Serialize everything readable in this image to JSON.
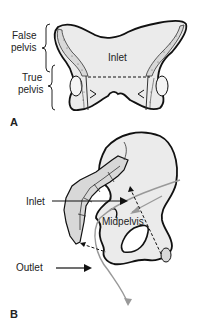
{
  "panel_a": {
    "letter": "A",
    "labels": {
      "false_pelvis_1": "False",
      "false_pelvis_2": "pelvis",
      "true_pelvis_1": "True",
      "true_pelvis_2": "pelvis",
      "inlet": "Inlet"
    }
  },
  "panel_b": {
    "letter": "B",
    "labels": {
      "inlet": "Inlet",
      "midpelvis": "Midpelvis",
      "outlet": "Outlet"
    }
  },
  "colors": {
    "bone_fill": "#ebebeb",
    "outline": "#111111",
    "axis_arrow": "#999999",
    "text": "#222222"
  }
}
